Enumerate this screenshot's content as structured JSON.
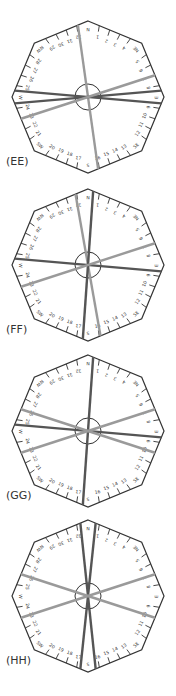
{
  "figure": {
    "type": "32-point wind compass octagon diagrams",
    "compass_labels": {
      "cardinal": [
        "N",
        "NE",
        "E",
        "SE",
        "S",
        "SW",
        "W",
        "NW"
      ],
      "numbered_points": [
        "1",
        "2",
        "3",
        "4",
        "5",
        "6",
        "7",
        "8",
        "9",
        "10",
        "11",
        "12",
        "13",
        "14",
        "15",
        "16",
        "17",
        "18",
        "19",
        "20",
        "21",
        "22",
        "23",
        "24",
        "25",
        "26",
        "27",
        "28",
        "29",
        "30",
        "31",
        "32"
      ]
    },
    "colors": {
      "outline": "#333333",
      "dark_line": "#555555",
      "light_line": "#9a9a9a"
    },
    "panels": [
      {
        "label": "(EE)",
        "cx": 88,
        "cy": 97,
        "lines": [
          {
            "from_deg": -8,
            "tone": "light"
          },
          {
            "from_deg": 85,
            "tone": "dark"
          },
          {
            "from_deg": 95,
            "tone": "dark"
          },
          {
            "from_deg": 72,
            "tone": "light"
          }
        ]
      },
      {
        "label": "(FF)",
        "cx": 88,
        "cy": 265,
        "lines": [
          {
            "from_deg": -10,
            "tone": "light"
          },
          {
            "from_deg": 4,
            "tone": "dark"
          },
          {
            "from_deg": 95,
            "tone": "dark"
          },
          {
            "from_deg": 72,
            "tone": "light"
          }
        ]
      },
      {
        "label": "(GG)",
        "cx": 88,
        "cy": 431,
        "lines": [
          {
            "from_deg": 4,
            "tone": "dark"
          },
          {
            "from_deg": 95,
            "tone": "dark"
          },
          {
            "from_deg": 72,
            "tone": "light"
          },
          {
            "from_deg": 108,
            "tone": "light"
          }
        ]
      },
      {
        "label": "(HH)",
        "cx": 88,
        "cy": 596,
        "lines": [
          {
            "from_deg": -6,
            "tone": "dark"
          },
          {
            "from_deg": 6,
            "tone": "dark"
          },
          {
            "from_deg": 72,
            "tone": "light"
          },
          {
            "from_deg": 108,
            "tone": "light"
          }
        ]
      }
    ]
  }
}
